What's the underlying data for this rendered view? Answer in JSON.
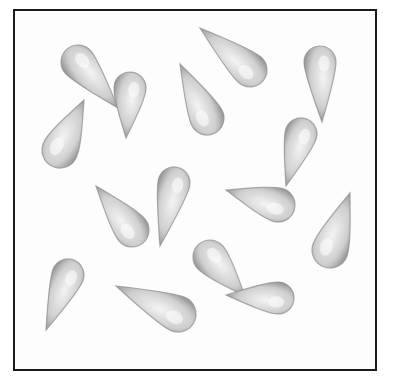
{
  "image": {
    "description": "Pencil-style illustration of fifteen grey teardrop shapes scattered in random orientations inside a square black-bordered frame",
    "colors": {
      "border": "#1a1a1a",
      "drop_dark": "#7a7a7a",
      "drop_light": "#f2f2f2",
      "background": "#ffffff"
    },
    "drops": [
      {
        "hx": 78,
        "hy": 62,
        "tx": 118,
        "ty": 108,
        "r": 17
      },
      {
        "hx": 130,
        "hy": 88,
        "tx": 126,
        "ty": 138,
        "r": 16
      },
      {
        "hx": 60,
        "hy": 150,
        "tx": 84,
        "ty": 100,
        "r": 18
      },
      {
        "hx": 207,
        "hy": 118,
        "tx": 180,
        "ty": 64,
        "r": 17
      },
      {
        "hx": 250,
        "hy": 70,
        "tx": 200,
        "ty": 28,
        "r": 17
      },
      {
        "hx": 320,
        "hy": 62,
        "tx": 322,
        "ty": 122,
        "r": 16
      },
      {
        "hx": 301,
        "hy": 134,
        "tx": 286,
        "ty": 186,
        "r": 16
      },
      {
        "hx": 174,
        "hy": 183,
        "tx": 160,
        "ty": 246,
        "r": 16
      },
      {
        "hx": 132,
        "hy": 230,
        "tx": 96,
        "ty": 186,
        "r": 17
      },
      {
        "hx": 278,
        "hy": 205,
        "tx": 226,
        "ty": 190,
        "r": 17
      },
      {
        "hx": 330,
        "hy": 250,
        "tx": 350,
        "ty": 193,
        "r": 18
      },
      {
        "hx": 210,
        "hy": 257,
        "tx": 245,
        "ty": 296,
        "r": 17
      },
      {
        "hx": 278,
        "hy": 298,
        "tx": 226,
        "ty": 295,
        "r": 16
      },
      {
        "hx": 68,
        "hy": 275,
        "tx": 46,
        "ty": 330,
        "r": 16
      },
      {
        "hx": 178,
        "hy": 314,
        "tx": 116,
        "ty": 286,
        "r": 18
      }
    ]
  }
}
